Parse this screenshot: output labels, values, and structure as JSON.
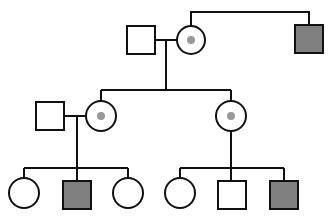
{
  "diagram": {
    "type": "pedigree",
    "colors": {
      "stroke": "#111111",
      "affected_fill": "#808080",
      "carrier_dot": "#999999",
      "unaffected_fill": "#ffffff"
    },
    "generations": [
      {
        "label": "I",
        "individuals": [
          {
            "id": "I-1",
            "sex": "male",
            "status": "unaffected"
          },
          {
            "id": "I-2",
            "sex": "female",
            "status": "carrier"
          },
          {
            "id": "I-3",
            "sex": "male",
            "status": "affected",
            "relation": "sibling of I-2"
          }
        ]
      },
      {
        "label": "II",
        "individuals": [
          {
            "id": "II-1",
            "sex": "male",
            "status": "unaffected",
            "relation": "spouse of II-2"
          },
          {
            "id": "II-2",
            "sex": "female",
            "status": "carrier",
            "relation": "child of I-1 & I-2"
          },
          {
            "id": "II-3",
            "sex": "female",
            "status": "carrier",
            "relation": "child of I-1 & I-2"
          }
        ]
      },
      {
        "label": "III",
        "individuals": [
          {
            "id": "III-1",
            "sex": "female",
            "status": "unaffected",
            "relation": "child of II-1 & II-2"
          },
          {
            "id": "III-2",
            "sex": "male",
            "status": "affected",
            "relation": "child of II-1 & II-2"
          },
          {
            "id": "III-3",
            "sex": "female",
            "status": "unaffected",
            "relation": "child of II-1 & II-2"
          },
          {
            "id": "III-4",
            "sex": "female",
            "status": "unaffected",
            "relation": "child of II-3"
          },
          {
            "id": "III-5",
            "sex": "male",
            "status": "unaffected",
            "relation": "child of II-3"
          },
          {
            "id": "III-6",
            "sex": "male",
            "status": "affected",
            "relation": "child of II-3"
          }
        ]
      }
    ]
  }
}
